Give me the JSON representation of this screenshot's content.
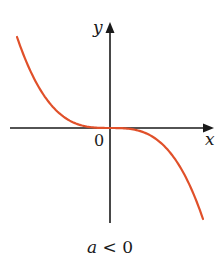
{
  "figure": {
    "y_axis_label": "y",
    "x_axis_label": "x",
    "origin_label": "0",
    "caption": {
      "variable": "a",
      "relation": " < 0"
    },
    "curve_color": "#e0502a",
    "axis_color": "#1a1a1a"
  },
  "chart_data": {
    "type": "line",
    "title": "",
    "function": "y = a x^3",
    "condition": "a < 0",
    "xlabel": "x",
    "ylabel": "y",
    "origin_label": "0",
    "grid": false,
    "legend": null,
    "series": [
      {
        "name": "y = ax^3 (a < 0)",
        "shape": "decreasing cubic through origin, point-symmetric about origin, flat at origin",
        "x": [
          -1.0,
          -0.8,
          -0.6,
          -0.4,
          -0.2,
          0,
          0.2,
          0.4,
          0.6,
          0.8,
          1.0
        ],
        "y": [
          1.0,
          0.512,
          0.216,
          0.064,
          0.008,
          0,
          -0.008,
          -0.064,
          -0.216,
          -0.512,
          -1.0
        ]
      }
    ]
  }
}
